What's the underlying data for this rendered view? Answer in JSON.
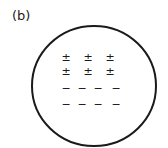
{
  "figure": {
    "label": "(b)",
    "shape": "circle",
    "rows": [
      {
        "symbols": [
          "±",
          "±",
          "±"
        ]
      },
      {
        "symbols": [
          "±",
          "±",
          "±"
        ]
      },
      {
        "symbols": [
          "−",
          "−",
          "−",
          "−"
        ]
      },
      {
        "symbols": [
          "−",
          "−",
          "−",
          "−"
        ]
      }
    ]
  }
}
